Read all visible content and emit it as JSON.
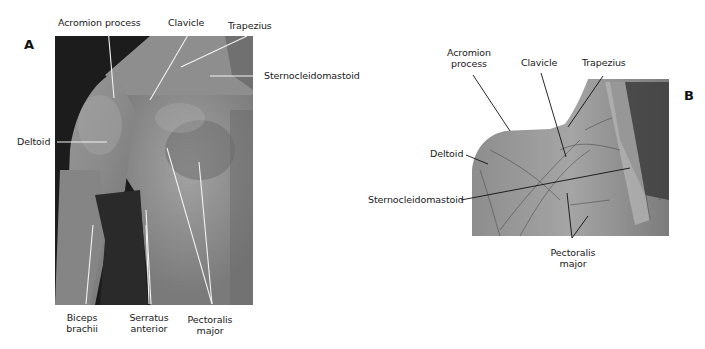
{
  "figure": {
    "panel_a": {
      "letter": "A",
      "description": "Photograph of male right shoulder and chest, anterior view",
      "labels": {
        "acromion_process": "Acromion process",
        "clavicle": "Clavicle",
        "trapezius": "Trapezius",
        "sternocleidomastoid": "Sternocleidomastoid",
        "deltoid": "Deltoid",
        "biceps_line1": "Biceps",
        "biceps_line2": "brachii",
        "serratus_line1": "Serratus",
        "serratus_line2": "anterior",
        "pectoralis_line1": "Pectoralis",
        "pectoralis_line2": "major"
      }
    },
    "panel_b": {
      "letter": "B",
      "description": "Cadaver dissection of shoulder and chest muscles",
      "labels": {
        "acromion_line1": "Acromion",
        "acromion_line2": "process",
        "clavicle": "Clavicle",
        "trapezius": "Trapezius",
        "deltoid": "Deltoid",
        "sternocleidomastoid": "Sternocleidomastoid",
        "pectoralis_line1": "Pectoralis",
        "pectoralis_line2": "major"
      }
    }
  }
}
